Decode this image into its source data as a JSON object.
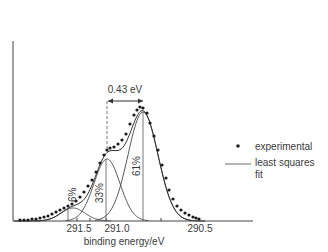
{
  "chart_data": {
    "type": "scatter",
    "title": "",
    "xlabel": "binding energy/eV",
    "ylabel": "",
    "x_ticks": [
      "291.5",
      "291.0",
      "290.5"
    ],
    "x_axis_reversed": true,
    "grid": false,
    "legend_position": "right",
    "legend": [
      {
        "marker": "dot",
        "label": "experimental"
      },
      {
        "marker": "line",
        "label_line1": "least squares",
        "label_line2": "fit"
      }
    ],
    "annotations": {
      "separation": "0.43 eV",
      "components": [
        {
          "label": "6%",
          "center_eV": 291.55
        },
        {
          "label": "33%",
          "center_eV": 291.07
        },
        {
          "label": "61%",
          "center_eV": 290.64
        }
      ]
    },
    "series": [
      {
        "name": "experimental",
        "kind": "points",
        "x_px": [
          20,
          24,
          28,
          32,
          36,
          40,
          44,
          48,
          52,
          56,
          60,
          64,
          68,
          72,
          76,
          80,
          84,
          88,
          92,
          96,
          100,
          104,
          107,
          110,
          114,
          118,
          122,
          126,
          130,
          134,
          137,
          140,
          143,
          147,
          150,
          154,
          158,
          162,
          166,
          169,
          173,
          177,
          181,
          185,
          189,
          193,
          196,
          199
        ],
        "y_px": [
          220,
          220,
          220,
          219,
          219,
          218,
          217,
          216,
          214,
          212,
          210,
          208,
          206,
          204,
          201,
          197,
          192,
          186,
          180,
          172,
          163,
          155,
          150,
          148,
          147,
          144,
          140,
          134,
          124,
          115,
          110,
          107,
          108,
          113,
          123,
          136,
          150,
          165,
          178,
          190,
          199,
          206,
          210,
          213,
          215,
          217,
          218,
          219
        ]
      },
      {
        "name": "component 6%",
        "kind": "gaussian",
        "center_px": 73,
        "peak_y_px": 208,
        "sigma_px": 12
      },
      {
        "name": "component 33%",
        "kind": "gaussian",
        "center_px": 107,
        "peak_y_px": 159,
        "sigma_px": 13
      },
      {
        "name": "component 61%",
        "kind": "gaussian",
        "center_px": 143,
        "peak_y_px": 112,
        "sigma_px": 15
      }
    ]
  },
  "labels": {
    "separation": "0.43 eV",
    "pct_small": "6%",
    "pct_mid": "33%",
    "pct_big": "61%",
    "tick1": "291.5",
    "tick2": "291.0",
    "tick3": "290.5",
    "xlabel": "binding energy/eV",
    "legend_exp": "experimental",
    "legend_fit1": "least squares",
    "legend_fit2": "fit"
  }
}
